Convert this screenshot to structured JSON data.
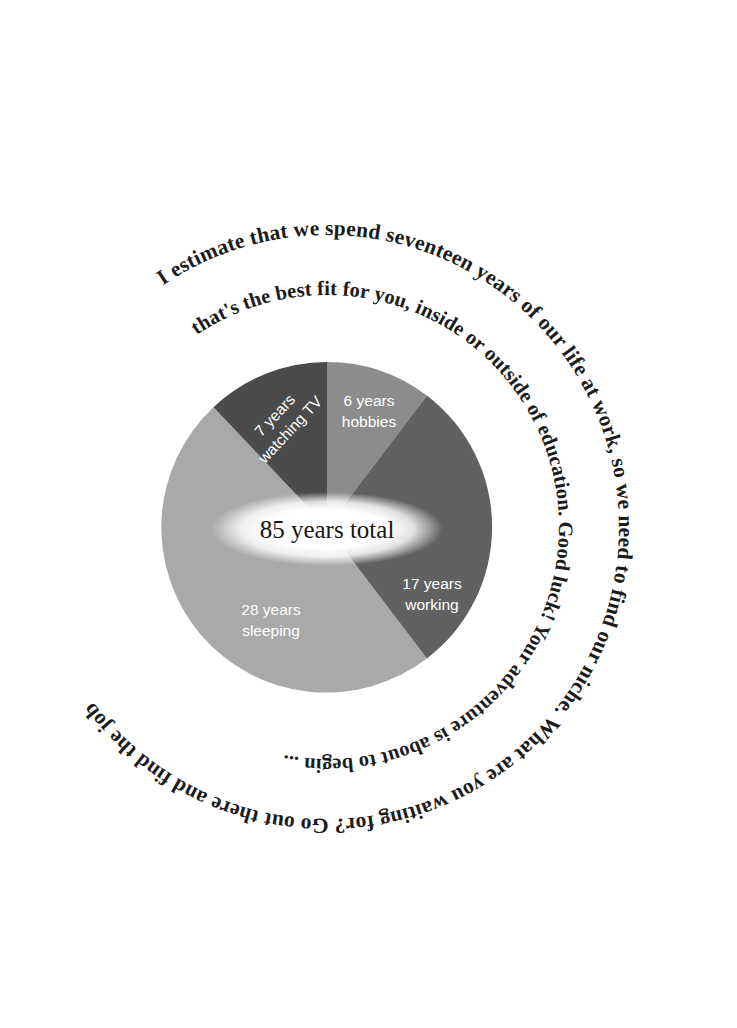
{
  "page": {
    "background": "#ffffff",
    "width": 737,
    "height": 1028
  },
  "ring_text": {
    "outer": "I estimate that we spend seventeen years of our life at work, so we need to find our niche. What are you waiting for? Go out there and find the job",
    "inner": "that's the best fit for you, inside or outside of education. Good luck! Your adventure is about to begin ...",
    "full_sentence": "I estimate that we spend seventeen years of our life at work, so we need to find our niche. What are you waiting for? Go out there and find the job that's the best fit for you, inside or outside of education. Good luck! Your adventure is about to begin ...",
    "color": "#1b1b1b"
  },
  "chart_data": {
    "type": "pie",
    "title": "85 years total",
    "center_label": "85 years total",
    "unit": "years",
    "total": 85,
    "categories": [
      "hobbies",
      "working",
      "sleeping",
      "watching TV"
    ],
    "values": [
      6,
      17,
      28,
      7
    ],
    "labels": [
      "6 years hobbies",
      "17 years working",
      "28 years sleeping",
      "7 years watching TV"
    ],
    "slices": [
      {
        "name": "hobbies",
        "value": 6,
        "value_text": "6 years",
        "name_text": "hobbies",
        "color": "#8c8c8c",
        "start_angle": 0,
        "end_angle": 25.4
      },
      {
        "name": "working",
        "value": 17,
        "value_text": "17 years",
        "name_text": "working",
        "color": "#616161",
        "start_angle": 25.4,
        "end_angle": 97.4
      },
      {
        "name": "sleeping",
        "value": 28,
        "value_text": "28 years",
        "name_text": "sleeping",
        "color": "#a9a9a9",
        "start_angle": 97.4,
        "end_angle": 216.0
      },
      {
        "name": "watching TV",
        "value": 7,
        "value_text": "7 years",
        "name_text": "watching TV",
        "color": "#4b4b4b",
        "start_angle": 326.3,
        "end_angle": 360
      },
      {
        "name": "unlabeled-remainder",
        "value": 26,
        "value_text": "",
        "name_text": "",
        "color": "#a9a9a9",
        "start_angle": 216.0,
        "end_angle": 326.3
      }
    ],
    "legend": "none",
    "grid": false,
    "label_color": "#ffffff",
    "center_label_color": "#151515"
  },
  "geometry": {
    "cx": 327,
    "cy": 527,
    "pie_radius": 165,
    "inner_ring_radius": 232,
    "outer_ring_radius": 292
  }
}
